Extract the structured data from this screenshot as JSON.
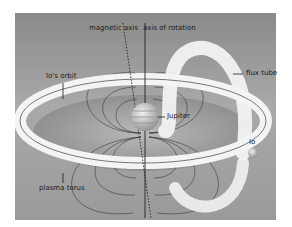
{
  "diagram": {
    "labels": {
      "magnetic_axis": "magnetic axis",
      "axis_of_rotation": "axis of rotation",
      "io_orbit": "Io's orbit",
      "flux_tube": "flux tube",
      "jupiter": "Jupiter",
      "io": "Io",
      "plasma_torus": "plasma torus"
    },
    "colors": {
      "background_light": "#b4b4b4",
      "background_dark": "#6e6e6e",
      "torus": "#f4f4f4",
      "field_lines": "#3a3a3a",
      "planet": "#d8d8d8"
    }
  }
}
